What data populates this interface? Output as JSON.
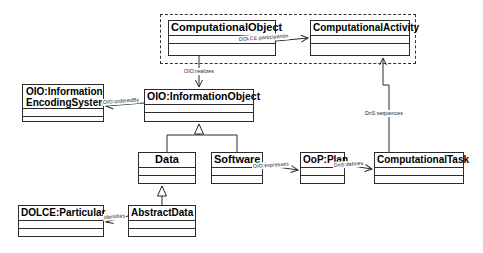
{
  "diagram": {
    "type": "uml-class-diagram",
    "title": "",
    "background_color": "#ffffff",
    "line_color": "#2b2b2b",
    "group": {
      "name": "computational-perdurant-group",
      "style": "dashed",
      "label": ""
    },
    "classes": [
      {
        "id": "computationalobject",
        "name": "ComputationalObject",
        "x": 168,
        "y": 20,
        "w": 108,
        "h": 36
      },
      {
        "id": "computationalactivity",
        "name": "ComputationalActivity",
        "x": 310,
        "y": 20,
        "w": 100,
        "h": 36
      },
      {
        "id": "infoencodingsystem",
        "name": "OIO:Information EncodingSystem",
        "x": 22,
        "y": 84,
        "w": 82,
        "h": 38
      },
      {
        "id": "informationobject",
        "name": "OIO:InformationObject",
        "x": 144,
        "y": 89,
        "w": 110,
        "h": 33
      },
      {
        "id": "data",
        "name": "Data",
        "x": 138,
        "y": 152,
        "w": 58,
        "h": 32
      },
      {
        "id": "software",
        "name": "Software",
        "x": 211,
        "y": 152,
        "w": 52,
        "h": 32
      },
      {
        "id": "ooplan",
        "name": "OoP:Plan",
        "x": 300,
        "y": 152,
        "w": 45,
        "h": 32
      },
      {
        "id": "computationaltask",
        "name": "ComputationalTask",
        "x": 374,
        "y": 152,
        "w": 90,
        "h": 32
      },
      {
        "id": "dolceparticular",
        "name": "DOLCE:Particular",
        "x": 18,
        "y": 205,
        "w": 86,
        "h": 32
      },
      {
        "id": "abstractdata",
        "name": "AbstractData",
        "x": 128,
        "y": 205,
        "w": 68,
        "h": 32
      }
    ],
    "relations": [
      {
        "id": "participantin",
        "label": "DOLCE:participantIn",
        "from": "computationalobject",
        "to": "computationalactivity",
        "kind": "association"
      },
      {
        "id": "realizes",
        "label": "OIO:realizes",
        "from": "computationalobject",
        "to": "informationobject",
        "kind": "association"
      },
      {
        "id": "orderedby",
        "label": "OIO:orderedBy",
        "from": "informationobject",
        "to": "infoencodingsystem",
        "kind": "association"
      },
      {
        "id": "expresses",
        "label": "OIO:expresses",
        "from": "software",
        "to": "ooplan",
        "kind": "association"
      },
      {
        "id": "defines",
        "label": "DnS:defines",
        "from": "ooplan",
        "to": "computationaltask",
        "kind": "association"
      },
      {
        "id": "sequences",
        "label": "DnS:sequences",
        "from": "computationaltask",
        "to": "computationalactivity",
        "kind": "association"
      },
      {
        "id": "identifies",
        "label": "identifies",
        "from": "abstractdata",
        "to": "dolceparticular",
        "kind": "association"
      },
      {
        "id": "gen-data",
        "label": "",
        "from": "data",
        "to": "informationobject",
        "kind": "generalization"
      },
      {
        "id": "gen-software",
        "label": "",
        "from": "software",
        "to": "informationobject",
        "kind": "generalization"
      },
      {
        "id": "gen-abstract",
        "label": "",
        "from": "abstractdata",
        "to": "data",
        "kind": "generalization"
      }
    ]
  }
}
